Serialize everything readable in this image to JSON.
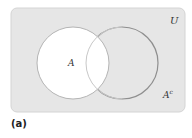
{
  "diagram": {
    "type": "venn",
    "universe_label": "U",
    "set_a_label": "A",
    "complement_label": "A",
    "complement_superscript": "c",
    "caption": "(a)",
    "colors": {
      "universe_fill": "#e6e6e6",
      "set_a_fill": "#ffffff",
      "outline": "#9a9a9a",
      "text": "#333333"
    }
  }
}
